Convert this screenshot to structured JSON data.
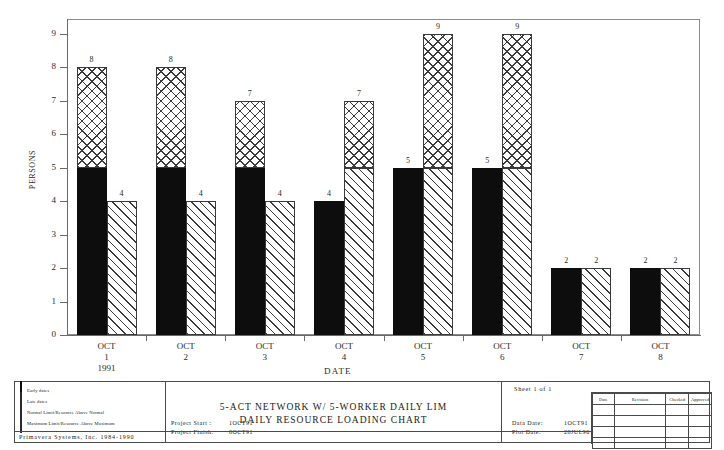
{
  "chart_data": {
    "type": "bar",
    "title": "5-ACT NETWORK W/ 5-WORKER DAILY LIM",
    "subtitle": "DAILY RESOURCE LOADING CHART",
    "xlabel": "DATE",
    "ylabel": "PERSONS",
    "ylim": [
      0,
      9
    ],
    "yticks": [
      0,
      1,
      2,
      3,
      4,
      5,
      6,
      7,
      8,
      9
    ],
    "grid": false,
    "normal_limit": 5,
    "categories": [
      "OCT 1 1991",
      "OCT 2",
      "OCT 3",
      "OCT 4",
      "OCT 5",
      "OCT 6",
      "OCT 7",
      "OCT 8"
    ],
    "category_lines": [
      [
        "OCT",
        "1",
        "1991"
      ],
      [
        "OCT",
        "2",
        ""
      ],
      [
        "OCT",
        "3",
        ""
      ],
      [
        "OCT",
        "4",
        ""
      ],
      [
        "OCT",
        "5",
        ""
      ],
      [
        "OCT",
        "6",
        ""
      ],
      [
        "OCT",
        "7",
        ""
      ],
      [
        "OCT",
        "8",
        ""
      ]
    ],
    "series": [
      {
        "name": "Early dates",
        "values": [
          8,
          8,
          7,
          4,
          5,
          5,
          2,
          2
        ]
      },
      {
        "name": "Late dates",
        "values": [
          4,
          4,
          4,
          7,
          9,
          9,
          2,
          2
        ]
      }
    ]
  },
  "axis": {
    "y_title": "PERSONS",
    "x_title": "DATE",
    "y_labels": [
      "0",
      "1",
      "2",
      "3",
      "4",
      "5",
      "6",
      "7",
      "8",
      "9"
    ]
  },
  "legend": {
    "items": [
      {
        "label": "Early dates",
        "swatch": "solid-black-swatch"
      },
      {
        "label": "Late dates",
        "swatch": "diagonal-hatch-swatch"
      },
      {
        "label": "Normal Limit/Resource Above Normal",
        "swatch": "cross-hatch-swatch"
      },
      {
        "label": "Maximum Limit/Resource Above Maximum",
        "swatch": "x-pattern-swatch"
      }
    ],
    "vendor": "Primavera Systems, Inc. 1984-1990"
  },
  "title_block": {
    "title_line_1": "5-ACT NETWORK W/ 5-WORKER DAILY LIM",
    "title_line_2": "DAILY RESOURCE LOADING CHART",
    "project_start_label": "Project Start :",
    "project_start_value": "1OCT91",
    "project_finish_label": "Project Finish:",
    "project_finish_value": "8OCT91",
    "data_date_label": "Data Date:",
    "data_date_value": "1OCT91",
    "plot_date_label": "Plot Date:",
    "plot_date_value": "28JUL90",
    "sheet": "Sheet 1 of 1",
    "revision_table": {
      "headers": [
        "Date",
        "Revision",
        "Checked",
        "Approved"
      ],
      "rows": [
        [
          "",
          "",
          "",
          ""
        ],
        [
          "",
          "",
          "",
          ""
        ],
        [
          "",
          "",
          "",
          ""
        ],
        [
          "",
          "",
          "",
          ""
        ]
      ]
    }
  }
}
